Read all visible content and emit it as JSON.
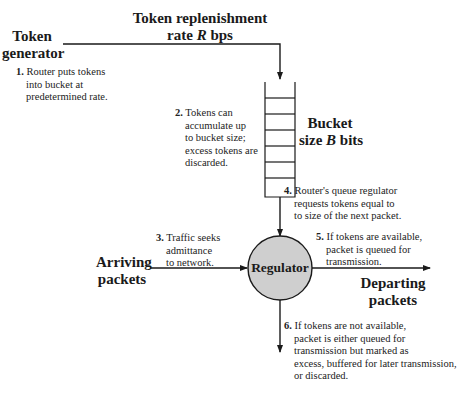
{
  "diagram": {
    "type": "token-bucket-flow",
    "colors": {
      "line": "#1a1a1a",
      "regulator_fill": "#cfcfcf",
      "text": "#1a1a1a"
    }
  },
  "labels": {
    "token_generator": [
      "Token",
      "generator"
    ],
    "replenishment": {
      "line1": "Token replenishment",
      "line2_pre": "rate ",
      "line2_var": "R",
      "line2_post": " bps"
    },
    "bucket": {
      "line1": "Bucket",
      "line2_pre": "size ",
      "line2_var": "B",
      "line2_post": " bits"
    },
    "arriving": [
      "Arriving",
      "packets"
    ],
    "departing": [
      "Departing",
      "packets"
    ],
    "regulator": "Regulator"
  },
  "steps": [
    {
      "num": "1.",
      "lines": [
        "Router puts tokens",
        "into bucket at",
        "predetermined rate."
      ]
    },
    {
      "num": "2.",
      "lines": [
        "Tokens can",
        "accumulate up",
        "to bucket size;",
        "excess tokens are",
        "discarded."
      ]
    },
    {
      "num": "3.",
      "lines": [
        "Traffic seeks",
        "admittance",
        "to network."
      ]
    },
    {
      "num": "4.",
      "lines": [
        "Router's queue regulator",
        "requests tokens equal to",
        "to size of the next packet."
      ]
    },
    {
      "num": "5.",
      "lines": [
        "If tokens are available,",
        "packet is queued for",
        "transmission."
      ]
    },
    {
      "num": "6.",
      "lines": [
        "If tokens are not available,",
        "packet is either queued for",
        "transmission but marked as",
        "excess, buffered for later transmission,",
        "or discarded."
      ]
    }
  ]
}
